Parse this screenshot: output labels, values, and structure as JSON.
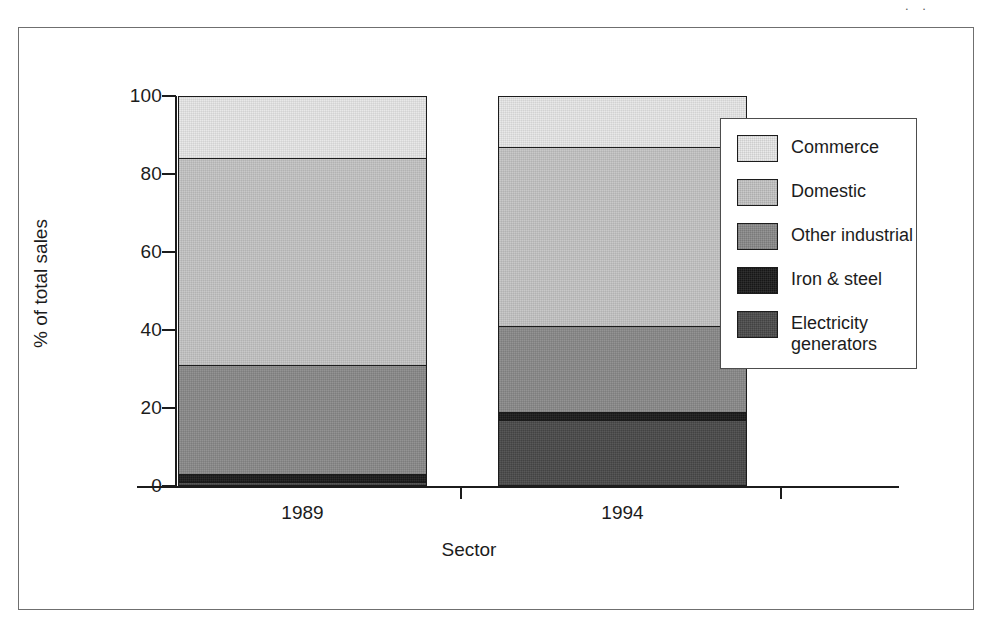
{
  "page": {
    "artifact_text": ". ."
  },
  "chart_data": {
    "type": "bar",
    "subtype": "stacked-bar-100-percent",
    "title": "",
    "xlabel": "Sector",
    "ylabel": "% of total sales",
    "categories": [
      "1989",
      "1994"
    ],
    "ylim": [
      0,
      100
    ],
    "yticks": [
      0,
      20,
      40,
      60,
      80,
      100
    ],
    "ytick_labels": [
      "0",
      "20",
      "40",
      "60",
      "80",
      "100"
    ],
    "grid": false,
    "legend_position": "right",
    "stack_order_bottom_to_top": [
      "Electricity generators",
      "Iron & steel",
      "Other industrial",
      "Domestic",
      "Commerce"
    ],
    "series": [
      {
        "name": "Electricity generators",
        "color": "#4a4a4a",
        "values": [
          1,
          17
        ]
      },
      {
        "name": "Iron & steel",
        "color": "#1a1a1a",
        "values": [
          2,
          2
        ]
      },
      {
        "name": "Other industrial",
        "color": "#8a8a8a",
        "values": [
          28,
          22
        ]
      },
      {
        "name": "Domestic",
        "color": "#c4c4c4",
        "values": [
          53,
          46
        ]
      },
      {
        "name": "Commerce",
        "color": "#e8e8e8",
        "values": [
          16,
          13
        ]
      }
    ],
    "cumulative_tops": {
      "1989": [
        1,
        3,
        31,
        84,
        100
      ],
      "1994": [
        17,
        19,
        41,
        87,
        100
      ]
    },
    "legend": [
      {
        "label": "Commerce",
        "color": "#e8e8e8"
      },
      {
        "label": "Domestic",
        "color": "#c4c4c4"
      },
      {
        "label": "Other industrial",
        "color": "#8a8a8a"
      },
      {
        "label": "Iron & steel",
        "color": "#1a1a1a"
      },
      {
        "label": "Electricity\ngenerators",
        "color": "#4a4a4a"
      }
    ]
  }
}
